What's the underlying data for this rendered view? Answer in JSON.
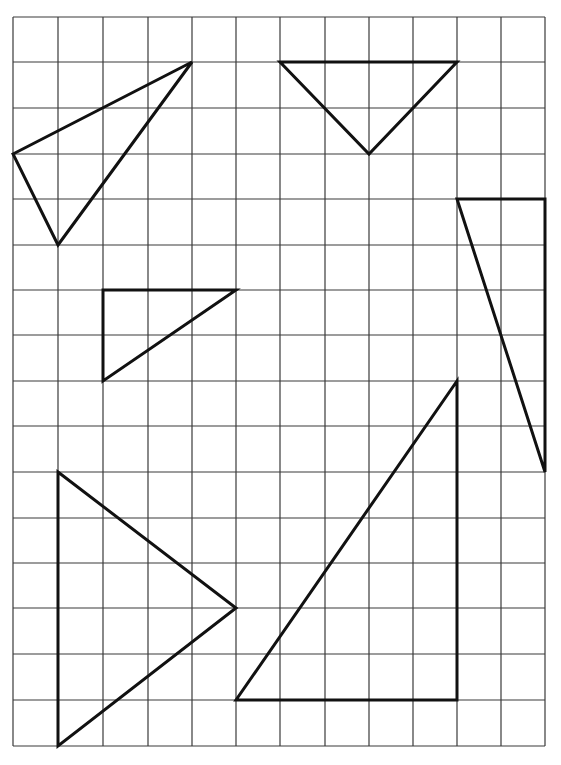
{
  "diagram": {
    "type": "grid-with-triangles",
    "grid": {
      "columns": 12,
      "rows": 16,
      "x_lines": [
        13,
        58,
        103,
        148,
        192,
        236,
        280,
        325,
        369,
        413,
        457,
        501,
        545
      ],
      "y_lines": [
        17,
        62,
        108,
        154,
        199,
        245,
        290,
        335,
        381,
        426,
        472,
        518,
        563,
        608,
        654,
        700,
        746
      ],
      "line_color": "#3a3a3a"
    },
    "stroke_color": "#111111",
    "triangles": [
      {
        "name": "triangle-top-left",
        "vertices": [
          [
            0,
            3
          ],
          [
            4,
            1
          ],
          [
            1,
            5
          ]
        ]
      },
      {
        "name": "triangle-top-inverted",
        "vertices": [
          [
            6,
            1
          ],
          [
            10,
            1
          ],
          [
            8,
            3
          ]
        ]
      },
      {
        "name": "triangle-right-tall",
        "vertices": [
          [
            10,
            4
          ],
          [
            12,
            4
          ],
          [
            12,
            10
          ]
        ]
      },
      {
        "name": "triangle-small-middle-left",
        "vertices": [
          [
            2,
            6
          ],
          [
            5,
            6
          ],
          [
            2,
            8
          ]
        ]
      },
      {
        "name": "triangle-bottom-left",
        "vertices": [
          [
            1,
            10
          ],
          [
            5,
            13
          ],
          [
            1,
            16
          ]
        ]
      },
      {
        "name": "triangle-bottom-right-large",
        "vertices": [
          [
            10,
            8
          ],
          [
            10,
            15
          ],
          [
            5,
            15
          ]
        ]
      }
    ]
  }
}
